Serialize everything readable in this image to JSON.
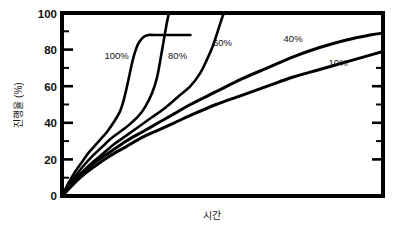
{
  "chart_data": {
    "type": "line",
    "title": "",
    "subtitle": "",
    "xlabel": "시간",
    "ylabel": "진행율 (%)",
    "xlim": [
      0,
      100
    ],
    "ylim": [
      0,
      100
    ],
    "grid": false,
    "legend_position": "inline-annotations",
    "x_tick_labels": [],
    "y_tick_labels": [
      "0",
      "20",
      "40",
      "60",
      "80",
      "100"
    ],
    "y_ticks": [
      0,
      20,
      40,
      60,
      80,
      100
    ],
    "y_minor_ticks": [
      10,
      30,
      50,
      70,
      90
    ],
    "colors": {
      "axis": "#000000",
      "curve": "#000000",
      "background": "#ffffff"
    },
    "series": [
      {
        "name": "100%",
        "label": "100%",
        "label_x": 17,
        "label_y": 77,
        "points": [
          [
            0,
            0
          ],
          [
            2,
            7
          ],
          [
            4,
            13
          ],
          [
            6,
            18
          ],
          [
            8,
            23
          ],
          [
            10,
            27
          ],
          [
            12,
            31
          ],
          [
            14,
            35
          ],
          [
            16,
            40
          ],
          [
            18,
            46
          ],
          [
            19,
            51
          ],
          [
            20,
            58
          ],
          [
            21,
            66
          ],
          [
            22,
            74
          ],
          [
            23,
            80
          ],
          [
            24,
            84
          ],
          [
            25.5,
            87
          ],
          [
            27,
            88
          ],
          [
            29,
            88
          ],
          [
            40,
            88
          ]
        ]
      },
      {
        "name": "80%",
        "label": "80%",
        "label_x": 36,
        "label_y": 77,
        "points": [
          [
            0,
            0
          ],
          [
            3,
            8
          ],
          [
            6,
            15
          ],
          [
            9,
            21
          ],
          [
            12,
            26
          ],
          [
            15,
            31
          ],
          [
            18,
            35
          ],
          [
            21,
            39
          ],
          [
            24,
            44
          ],
          [
            26,
            49
          ],
          [
            28,
            56
          ],
          [
            29.5,
            64
          ],
          [
            30.5,
            73
          ],
          [
            31.5,
            83
          ],
          [
            32.5,
            93
          ],
          [
            33.3,
            100
          ]
        ]
      },
      {
        "name": "60%",
        "label": "60%",
        "label_x": 50,
        "label_y": 84,
        "points": [
          [
            0,
            0
          ],
          [
            4,
            9
          ],
          [
            8,
            16
          ],
          [
            12,
            22
          ],
          [
            16,
            28
          ],
          [
            20,
            33
          ],
          [
            24,
            38
          ],
          [
            28,
            43
          ],
          [
            32,
            48
          ],
          [
            36,
            54
          ],
          [
            40,
            60
          ],
          [
            43,
            67
          ],
          [
            45,
            74
          ],
          [
            47,
            82
          ],
          [
            48.5,
            90
          ],
          [
            50,
            98
          ],
          [
            50.5,
            100
          ]
        ]
      },
      {
        "name": "40%",
        "label": "40%",
        "label_x": 72,
        "label_y": 86,
        "points": [
          [
            0,
            0
          ],
          [
            5,
            10
          ],
          [
            10,
            18
          ],
          [
            15,
            24
          ],
          [
            20,
            30
          ],
          [
            25,
            35
          ],
          [
            30,
            40
          ],
          [
            35,
            45
          ],
          [
            40,
            50
          ],
          [
            48,
            57
          ],
          [
            56,
            64
          ],
          [
            64,
            70
          ],
          [
            72,
            76
          ],
          [
            80,
            81
          ],
          [
            88,
            85
          ],
          [
            96,
            88
          ],
          [
            100,
            89
          ]
        ]
      },
      {
        "name": "10%",
        "label": "10%",
        "label_x": 86,
        "label_y": 73,
        "points": [
          [
            0,
            0
          ],
          [
            5,
            9
          ],
          [
            10,
            16
          ],
          [
            15,
            22
          ],
          [
            20,
            27
          ],
          [
            25,
            32
          ],
          [
            30,
            36
          ],
          [
            35,
            40
          ],
          [
            40,
            44
          ],
          [
            48,
            50
          ],
          [
            56,
            55
          ],
          [
            64,
            60
          ],
          [
            72,
            65
          ],
          [
            80,
            69
          ],
          [
            88,
            73
          ],
          [
            96,
            77
          ],
          [
            100,
            79
          ]
        ]
      }
    ]
  },
  "axes": {
    "y_label_text": "진행율 (%)",
    "x_label_text": "시간"
  }
}
